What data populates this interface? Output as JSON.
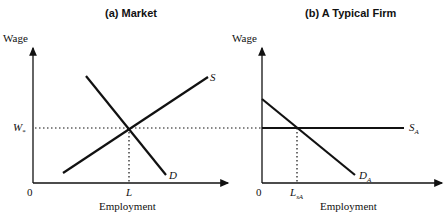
{
  "panels": [
    {
      "title": "(a)  Market",
      "y_axis_label": "Wage",
      "x_axis_label": "Employment",
      "origin_label": "0",
      "wage_label": "W",
      "wage_sub": "*",
      "employment_label": "L",
      "curves": {
        "supply": "S",
        "demand": "D"
      }
    },
    {
      "title": "(b)  A Typical Firm",
      "y_axis_label": "Wage",
      "x_axis_label": "Employment",
      "origin_label": "0",
      "employment_label": "L",
      "employment_sub": "sA",
      "curves": {
        "supply": "S",
        "supply_sub": "A",
        "demand": "D",
        "demand_sub": "A"
      }
    }
  ],
  "colors": {
    "line": "#111111",
    "background": "#ffffff"
  }
}
